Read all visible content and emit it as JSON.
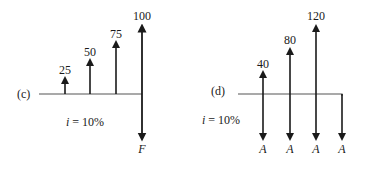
{
  "diagrams": [
    {
      "id": "c",
      "label": "(c)",
      "interest_label": "i = 10%",
      "interest_var": "i",
      "interest_value": "= 10%",
      "up_flows": [
        {
          "value": "25",
          "period": 1
        },
        {
          "value": "50",
          "period": 2
        },
        {
          "value": "75",
          "period": 3
        },
        {
          "value": "100",
          "period": 4
        }
      ],
      "down_flows": [
        {
          "value": "F",
          "period": 4
        }
      ]
    },
    {
      "id": "d",
      "label": "(d)",
      "interest_label": "i = 10%",
      "interest_var": "i",
      "interest_value": "= 10%",
      "up_flows": [
        {
          "value": "40",
          "period": 1
        },
        {
          "value": "80",
          "period": 2
        },
        {
          "value": "120",
          "period": 3
        }
      ],
      "down_flows": [
        {
          "value": "A",
          "period": 1
        },
        {
          "value": "A",
          "period": 2
        },
        {
          "value": "A",
          "period": 3
        },
        {
          "value": "A",
          "period": 4
        }
      ]
    }
  ]
}
